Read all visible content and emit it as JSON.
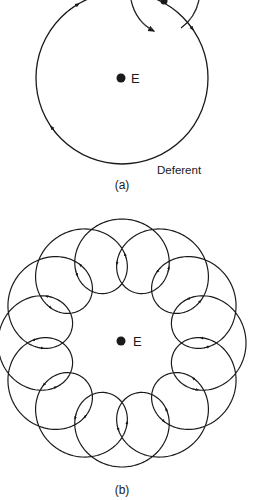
{
  "panel_a": {
    "label": "(a)",
    "earth_label": "E",
    "deferent_label": "Deferent",
    "earth": {
      "cx": 121,
      "cy": 78,
      "r": 4.5
    },
    "deferent": {
      "cx": 122,
      "cy": 78,
      "r": 86
    },
    "epicycle_center": {
      "cx": 164,
      "cy": 1,
      "r": 3.5
    },
    "arrows_on_deferent_deg": [
      222,
      128,
      42
    ]
  },
  "panel_b": {
    "label": "(b)",
    "earth_label": "E",
    "earth": {
      "cx": 121,
      "cy": 341,
      "r": 4.5
    },
    "center": {
      "cx": 122,
      "cy": 343
    },
    "deferent_radius": 88,
    "epicycle_radius": 36,
    "loops": 12
  },
  "colors": {
    "ink": "#1a1a1a",
    "background": "#ffffff"
  }
}
